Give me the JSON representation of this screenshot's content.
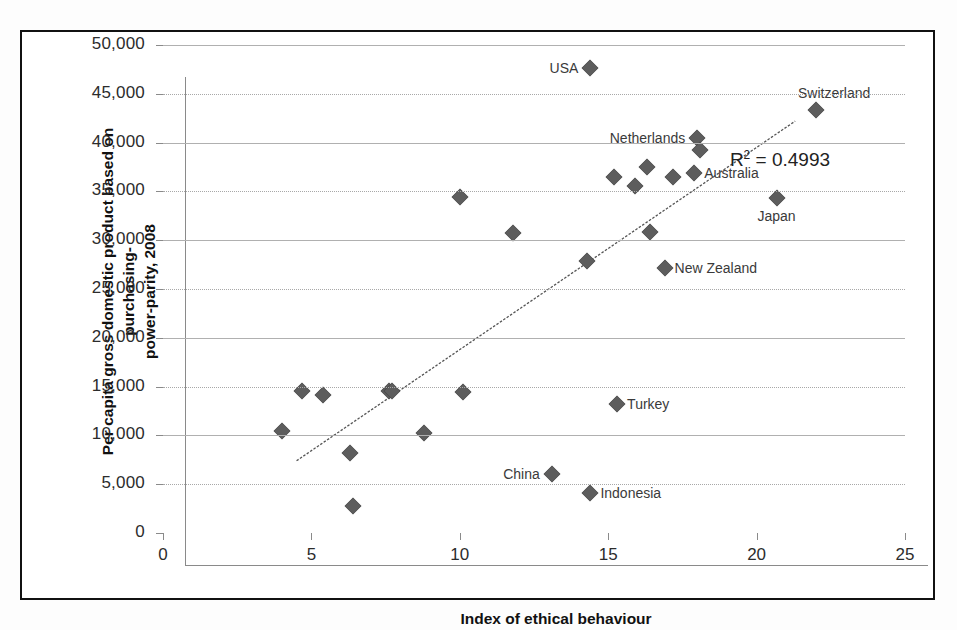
{
  "figure": {
    "frame_color": "#111111",
    "background": "#ffffff"
  },
  "chart_data": {
    "type": "scatter",
    "title": "",
    "xlabel": "Index of ethical behaviour",
    "ylabel": "Per capita gross domestic product based on purchasing-power-parity, 2008",
    "ylabel_line1": "Per capita gross domestic product based on purchasing-",
    "ylabel_line2": "power-parity, 2008",
    "xlim": [
      0,
      25
    ],
    "ylim": [
      0,
      50000
    ],
    "xticks": [
      "0",
      "5",
      "10",
      "15",
      "20",
      "25"
    ],
    "xtick_values": [
      0,
      5,
      10,
      15,
      20,
      25
    ],
    "yticks": [
      "0",
      "5,000",
      "10,000",
      "15,000",
      "20,000",
      "25,000",
      "30,000",
      "35,000",
      "40,000",
      "45,000",
      "50,000"
    ],
    "ytick_values": [
      0,
      5000,
      10000,
      15000,
      20000,
      25000,
      30000,
      35000,
      40000,
      45000,
      50000
    ],
    "grid": true,
    "grid_style": "alternating solid and dotted horizontal gridlines",
    "legend": "none",
    "marker": "diamond",
    "marker_color": "#5d5d5d",
    "annotations": [
      {
        "text": "R² = 0.4993",
        "x": 19.1,
        "y": 38100
      }
    ],
    "r_squared": "0.4993",
    "r_squared_display": "R² = 0.4993",
    "trendline": {
      "type": "linear",
      "x_start": 4.5,
      "y_start": 7400,
      "x_end": 21.3,
      "y_end": 42200
    },
    "points": [
      {
        "label": "",
        "x": 4.0,
        "y": 10400
      },
      {
        "label": "",
        "x": 4.7,
        "y": 14600
      },
      {
        "label": "",
        "x": 5.4,
        "y": 14100
      },
      {
        "label": "",
        "x": 6.3,
        "y": 8200
      },
      {
        "label": "",
        "x": 6.4,
        "y": 2800
      },
      {
        "label": "",
        "x": 7.6,
        "y": 14500
      },
      {
        "label": "",
        "x": 7.7,
        "y": 14500
      },
      {
        "label": "",
        "x": 8.8,
        "y": 10200
      },
      {
        "label": "",
        "x": 10.0,
        "y": 34400
      },
      {
        "label": "",
        "x": 10.1,
        "y": 14400
      },
      {
        "label": "",
        "x": 11.8,
        "y": 30700
      },
      {
        "label": "China",
        "x": 13.1,
        "y": 6000,
        "label_pos": "left"
      },
      {
        "label": "Turkey",
        "x": 15.3,
        "y": 13200,
        "label_pos": "right"
      },
      {
        "label": "",
        "x": 14.3,
        "y": 27900
      },
      {
        "label": "Indonesia",
        "x": 14.4,
        "y": 4100,
        "label_pos": "right"
      },
      {
        "label": "USA",
        "x": 14.4,
        "y": 47600,
        "label_pos": "left"
      },
      {
        "label": "",
        "x": 15.2,
        "y": 36500
      },
      {
        "label": "",
        "x": 15.9,
        "y": 35600
      },
      {
        "label": "",
        "x": 16.3,
        "y": 37500
      },
      {
        "label": "",
        "x": 16.4,
        "y": 30800
      },
      {
        "label": "New Zealand",
        "x": 16.9,
        "y": 27200,
        "label_pos": "right"
      },
      {
        "label": "",
        "x": 17.2,
        "y": 36500
      },
      {
        "label": "Australia",
        "x": 17.9,
        "y": 36900,
        "label_pos": "right"
      },
      {
        "label": "Netherlands",
        "x": 18.0,
        "y": 40500,
        "label_pos": "left"
      },
      {
        "label": "",
        "x": 18.1,
        "y": 39200
      },
      {
        "label": "Japan",
        "x": 20.7,
        "y": 34300,
        "label_pos": "below"
      },
      {
        "label": "Switzerland",
        "x": 22.0,
        "y": 43300,
        "label_pos": "above"
      }
    ]
  }
}
